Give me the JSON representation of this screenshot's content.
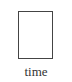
{
  "diagram": {
    "top_fragment": "",
    "xlabel": "time",
    "frame_color": "#444444"
  }
}
